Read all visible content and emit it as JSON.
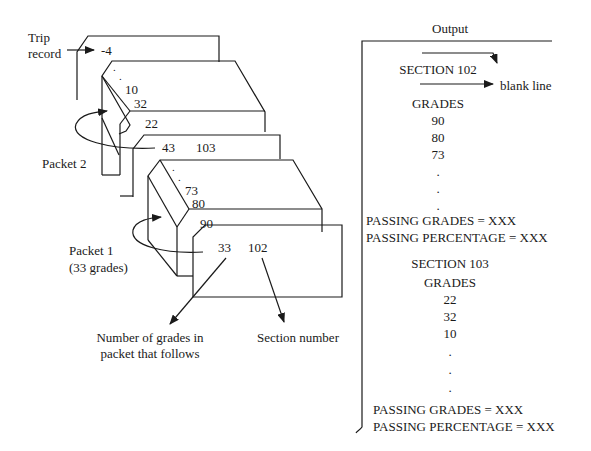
{
  "diagram": {
    "trip_record_label": [
      "Trip",
      "record"
    ],
    "trip_record_value": "-4",
    "packet2": {
      "label": "Packet 2",
      "count": "43",
      "section": "103",
      "grades_visible": [
        "22",
        "32",
        "10"
      ],
      "ellipsis": [
        ".",
        "."
      ]
    },
    "packet1": {
      "label": "Packet 1",
      "sublabel": "(33 grades)",
      "count": "33",
      "section": "102",
      "grades_visible": [
        "90",
        "80",
        "73"
      ],
      "ellipsis": [
        ".",
        "."
      ]
    },
    "callouts": {
      "count_label": [
        "Number of grades in",
        "packet that follows"
      ],
      "section_label": "Section number"
    }
  },
  "output": {
    "title": "Output",
    "blank_line_label": "blank line",
    "sections": [
      {
        "heading": "SECTION 102",
        "grades_heading": "GRADES",
        "grades": [
          "90",
          "80",
          "73"
        ],
        "ellipsis": [
          ".",
          ".",
          "."
        ],
        "passing_grades": "PASSING GRADES = XXX",
        "passing_percentage": "PASSING PERCENTAGE = XXX"
      },
      {
        "heading": "SECTION 103",
        "grades_heading": "GRADES",
        "grades": [
          "22",
          "32",
          "10"
        ],
        "ellipsis": [
          ".",
          ".",
          "."
        ],
        "passing_grades": "PASSING GRADES = XXX",
        "passing_percentage": "PASSING PERCENTAGE = XXX"
      }
    ]
  },
  "colors": {
    "ink": "#1a1a1a",
    "background": "#ffffff"
  }
}
